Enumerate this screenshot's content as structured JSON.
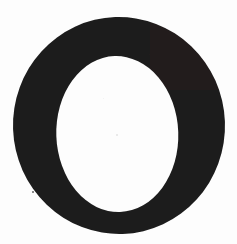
{
  "image": {
    "kind": "scanned-letterform",
    "character": "O",
    "description": "Scanned printed capital letter O, didone serif style",
    "width": 237,
    "height": 244,
    "background_color": "#fdfdfd",
    "ink_color": "#1c1b1b",
    "ink_color_soft": "#262525"
  },
  "glyph": {
    "label": "O",
    "outer": {
      "center_x": 119,
      "center_y": 125.5,
      "radius_x": 106,
      "radius_y": 108.5,
      "left": 13,
      "right": 225,
      "top": 17,
      "bottom": 234
    },
    "counter": {
      "center_x": 117,
      "center_y": 134,
      "radius_x": 61,
      "radius_y": 78,
      "left": 56,
      "right": 178,
      "top": 56,
      "bottom": 212
    },
    "rotation_deg": -2,
    "stroke_left_px": 40,
    "stroke_right_px": 44,
    "stroke_top_px": 38,
    "stroke_bottom_px": 25
  },
  "artifacts": {
    "specks": [
      {
        "name": "speck-lower-left",
        "x": 33,
        "y": 192,
        "size": 2.4,
        "color": "#3a3a3a",
        "opacity": 0.78
      },
      {
        "name": "speck-counter-center",
        "x": 117,
        "y": 135,
        "size": 2.0,
        "color": "#cfcfcf",
        "opacity": 0.55
      },
      {
        "name": "speck-counter-upper",
        "x": 104,
        "y": 99,
        "size": 1.3,
        "color": "#e2e2e2",
        "opacity": 0.5
      }
    ]
  },
  "a11y": {
    "caption": "O"
  }
}
